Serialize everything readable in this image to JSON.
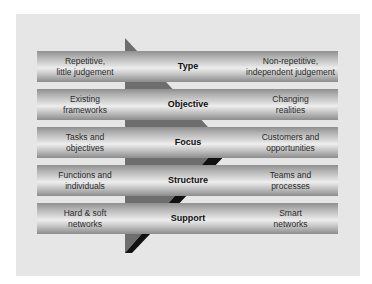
{
  "diagram": {
    "type": "comparison-shift",
    "direction": "left-to-right",
    "rows": [
      {
        "dimension": "Type",
        "from": "Repetitive,\nlittle judgement",
        "to": "Non-repetitive,\nindependent judgement"
      },
      {
        "dimension": "Objective",
        "from": "Existing\nframeworks",
        "to": "Changing\nrealities"
      },
      {
        "dimension": "Focus",
        "from": "Tasks and\nobjectives",
        "to": "Customers and\nopportunities"
      },
      {
        "dimension": "Structure",
        "from": "Functions and\nindividuals",
        "to": "Teams and\nprocesses"
      },
      {
        "dimension": "Support",
        "from": "Hard & soft\nnetworks",
        "to": "Smart\nnetworks"
      }
    ],
    "arrow_icon": "right-chevron-arrow"
  },
  "colors": {
    "panel": "#e6e6e6",
    "arrow_fill": "#6e6e6e",
    "arrow_shadow": "#111111",
    "bar_light": "#eeeeee",
    "bar_dark": "#8c8c8c"
  }
}
